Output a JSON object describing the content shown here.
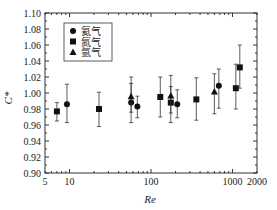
{
  "chart_data": {
    "type": "scatter",
    "title": "",
    "xlabel": "Re",
    "ylabel": "C*",
    "xscale": "log",
    "xlim": [
      5,
      2000
    ],
    "ylim": [
      0.9,
      1.1
    ],
    "x_ticks": [
      5,
      10,
      100,
      1000,
      2000
    ],
    "x_tick_labels": [
      "5",
      "10",
      "100",
      "1000",
      "2000"
    ],
    "y_ticks": [
      0.9,
      0.92,
      0.94,
      0.96,
      0.98,
      1.0,
      1.02,
      1.04,
      1.06,
      1.08,
      1.1
    ],
    "y_tick_labels": [
      "0.90",
      "0.92",
      "0.94",
      "0.96",
      "0.98",
      "1.00",
      "1.02",
      "1.04",
      "1.06",
      "1.08",
      "1.10"
    ],
    "grid": false,
    "legend_position": "upper-left",
    "series": [
      {
        "name": "氦气",
        "marker": "circle",
        "points": [
          {
            "x": 9.3,
            "y": 0.986,
            "ylo": 0.963,
            "yhi": 1.011
          },
          {
            "x": 57,
            "y": 0.988,
            "ylo": 0.963,
            "yhi": 1.012
          },
          {
            "x": 68,
            "y": 0.983,
            "ylo": 0.969,
            "yhi": 0.996
          },
          {
            "x": 210,
            "y": 0.986,
            "ylo": 0.969,
            "yhi": 1.004
          },
          {
            "x": 680,
            "y": 1.009,
            "ylo": 0.981,
            "yhi": 1.03
          }
        ]
      },
      {
        "name": "氮气",
        "marker": "square",
        "points": [
          {
            "x": 7,
            "y": 0.977,
            "ylo": 0.965,
            "yhi": 0.988
          },
          {
            "x": 23,
            "y": 0.98,
            "ylo": 0.958,
            "yhi": 1.001
          },
          {
            "x": 130,
            "y": 0.995,
            "ylo": 0.97,
            "yhi": 1.02
          },
          {
            "x": 175,
            "y": 0.988,
            "ylo": 0.963,
            "yhi": 1.008
          },
          {
            "x": 360,
            "y": 0.992,
            "ylo": 0.966,
            "yhi": 1.019
          },
          {
            "x": 1100,
            "y": 1.006,
            "ylo": 0.98,
            "yhi": 1.036
          },
          {
            "x": 1230,
            "y": 1.032,
            "ylo": 1.006,
            "yhi": 1.06
          }
        ]
      },
      {
        "name": "氩气",
        "marker": "triangle",
        "points": [
          {
            "x": 57,
            "y": 0.996,
            "ylo": 0.976,
            "yhi": 1.02
          },
          {
            "x": 175,
            "y": 0.997,
            "ylo": 0.975,
            "yhi": 1.022
          },
          {
            "x": 600,
            "y": 1.002,
            "ylo": 0.974,
            "yhi": 1.024
          }
        ]
      }
    ]
  }
}
